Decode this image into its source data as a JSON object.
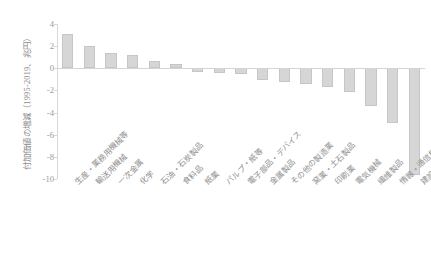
{
  "chart_data": {
    "type": "bar",
    "title": "",
    "subtitle": "",
    "xlabel": "",
    "ylabel": "付加価値の増減（1995-2019、兆円）",
    "ylim": [
      -10,
      4
    ],
    "yticks": [
      4,
      2,
      0,
      -2,
      -4,
      -6,
      -8,
      -10
    ],
    "ytick_labels": [
      "4",
      "2",
      "0",
      "-2",
      "-4",
      "-6",
      "-8",
      "-10"
    ],
    "grid": false,
    "legend": null,
    "legend_position": "none",
    "bar_color": "#d6d6d6",
    "bar_edge_color": "#c6c6c6",
    "zero_line_color": "#d4d4d4",
    "axis_color": "#d8d8d8",
    "categories": [
      "生産・業務用機械等",
      "輸送用機械",
      "一次金属",
      "化学",
      "石油・石炭製品",
      "食料品",
      "紙業",
      "パルプ・紙等",
      "電子部品・デバイス",
      "金属製品",
      "その他の製造業",
      "窯業・土石製品",
      "印刷業",
      "電気機械",
      "繊維製品",
      "情報・通信機器",
      "建設業"
    ],
    "values": [
      3.1,
      2.05,
      1.35,
      1.2,
      0.7,
      0.35,
      -0.3,
      -0.45,
      -0.5,
      -1.1,
      -1.2,
      -1.45,
      -1.7,
      -2.15,
      -3.45,
      -4.9,
      -9.6
    ]
  }
}
